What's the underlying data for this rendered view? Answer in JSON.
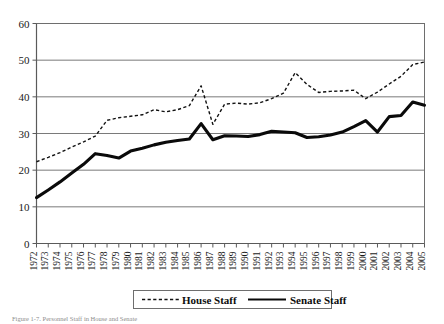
{
  "chart_data": {
    "type": "line",
    "title": "",
    "xlabel": "",
    "ylabel": "",
    "ylim": [
      0,
      60
    ],
    "ytick_step": 10,
    "grid": true,
    "legend_position": "bottom-center",
    "yticks": [
      "0",
      "10",
      "20",
      "30",
      "40",
      "50",
      "60"
    ],
    "categories": [
      "1972",
      "1973",
      "1974",
      "1975",
      "1976",
      "1977",
      "1978",
      "1979",
      "1980",
      "1981",
      "1982",
      "1983",
      "1984",
      "1985",
      "1986",
      "1987",
      "1988",
      "1989",
      "1990",
      "1991",
      "1992",
      "1993",
      "1994",
      "1995",
      "1996",
      "1997",
      "1998",
      "1999",
      "2000",
      "2001",
      "2002",
      "2003",
      "2004",
      "2005"
    ],
    "series": [
      {
        "name": "House Staff",
        "style": "dashed",
        "color": "#111111",
        "values": [
          22.3,
          23.5,
          24.8,
          26.3,
          27.7,
          29.3,
          33.6,
          34.3,
          34.7,
          35.1,
          36.5,
          35.9,
          36.5,
          37.6,
          43.0,
          32.5,
          38.0,
          38.3,
          38.0,
          38.4,
          39.5,
          41.0,
          46.6,
          43.4,
          41.2,
          41.5,
          41.6,
          41.8,
          39.5,
          41.3,
          43.5,
          45.6,
          48.8,
          49.5
        ]
      },
      {
        "name": "Senate Staff",
        "style": "solid",
        "color": "#0a0a0a",
        "values": [
          12.5,
          14.6,
          16.8,
          19.2,
          21.6,
          24.5,
          24.0,
          23.3,
          25.2,
          26.0,
          26.9,
          27.6,
          28.1,
          28.5,
          32.7,
          28.3,
          29.4,
          29.3,
          29.2,
          29.7,
          30.6,
          30.4,
          30.2,
          28.9,
          29.1,
          29.6,
          30.4,
          31.9,
          33.5,
          30.4,
          34.6,
          34.9,
          38.6,
          37.7
        ]
      }
    ]
  },
  "legend": {
    "entries": [
      {
        "label": "House Staff",
        "style": "dashed"
      },
      {
        "label": "Senate Staff",
        "style": "solid"
      }
    ]
  },
  "caption": {
    "text": "Figure 1-7. Personnel Staff in House and Senate"
  }
}
